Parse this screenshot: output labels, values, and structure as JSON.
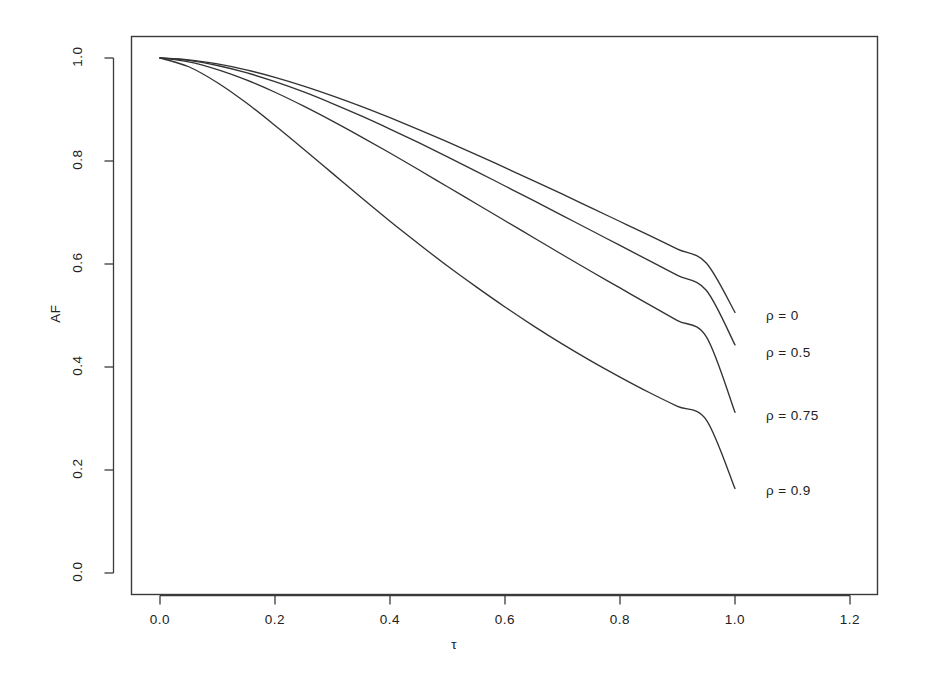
{
  "chart_data": {
    "type": "line",
    "title": "",
    "subtitle": "",
    "xlabel": "τ",
    "ylabel": "AF",
    "xlim": [
      -0.03,
      1.28
    ],
    "ylim": [
      -0.04,
      1.05
    ],
    "xticks": [
      "0.0",
      "0.2",
      "0.4",
      "0.6",
      "0.8",
      "1.0",
      "1.2"
    ],
    "xtick_values": [
      0.0,
      0.2,
      0.4,
      0.6,
      0.8,
      1.0,
      1.2
    ],
    "yticks": [
      "0.0",
      "0.2",
      "0.4",
      "0.6",
      "0.8",
      "1.0"
    ],
    "ytick_values": [
      0.0,
      0.2,
      0.4,
      0.6,
      0.8,
      1.0
    ],
    "grid": false,
    "legend_position": "right-inline-annotations",
    "line_color": "#333333",
    "background_color": "#ffffff",
    "x": [
      0.0,
      0.05,
      0.1,
      0.15,
      0.2,
      0.25,
      0.3,
      0.35,
      0.4,
      0.45,
      0.5,
      0.55,
      0.6,
      0.65,
      0.7,
      0.75,
      0.8,
      0.85,
      0.9,
      0.95,
      1.0
    ],
    "series": [
      {
        "name": "rho = 0",
        "label": "ρ = 0",
        "rho": 0,
        "label_x": 1.04,
        "label_y": 0.497,
        "values": [
          1.0,
          0.9965,
          0.9885,
          0.977,
          0.9625,
          0.9455,
          0.9265,
          0.906,
          0.884,
          0.861,
          0.837,
          0.8125,
          0.787,
          0.7615,
          0.7355,
          0.709,
          0.6825,
          0.656,
          0.629,
          0.602,
          0.506
        ]
      },
      {
        "name": "rho = 0.5",
        "label": "ρ = 0.5",
        "rho": 0.5,
        "label_x": 1.04,
        "label_y": 0.425,
        "values": [
          1.0,
          0.9955,
          0.9855,
          0.9715,
          0.954,
          0.934,
          0.9115,
          0.8875,
          0.862,
          0.8355,
          0.808,
          0.78,
          0.7515,
          0.723,
          0.694,
          0.665,
          0.636,
          0.607,
          0.578,
          0.549,
          0.443
        ]
      },
      {
        "name": "rho = 0.75",
        "label": "ρ = 0.75",
        "rho": 0.75,
        "label_x": 1.04,
        "label_y": 0.303,
        "values": [
          1.0,
          0.9925,
          0.9775,
          0.9575,
          0.9335,
          0.9065,
          0.8775,
          0.847,
          0.8155,
          0.783,
          0.75,
          0.717,
          0.684,
          0.651,
          0.618,
          0.5855,
          0.5535,
          0.5215,
          0.49,
          0.459,
          0.312
        ]
      },
      {
        "name": "rho = 0.9",
        "label": "ρ = 0.9",
        "rho": 0.9,
        "label_x": 1.04,
        "label_y": 0.158,
        "values": [
          1.0,
          0.983,
          0.952,
          0.913,
          0.869,
          0.823,
          0.776,
          0.729,
          0.683,
          0.639,
          0.596,
          0.5555,
          0.5165,
          0.4795,
          0.4445,
          0.4115,
          0.3805,
          0.351,
          0.3235,
          0.2975,
          0.164
        ]
      }
    ]
  }
}
